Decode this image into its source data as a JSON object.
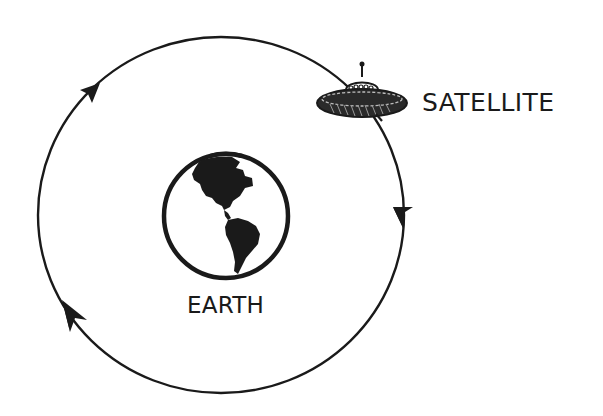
{
  "diagram": {
    "labels": {
      "satellite": "SATELLITE",
      "earth": "EARTH"
    },
    "orbit": {
      "direction": "clockwise",
      "arrow_count": 3
    },
    "icons": {
      "satellite": "flying-saucer-icon",
      "earth": "globe-americas-icon"
    },
    "colors": {
      "ink": "#1a1a1a",
      "background": "#ffffff"
    }
  }
}
